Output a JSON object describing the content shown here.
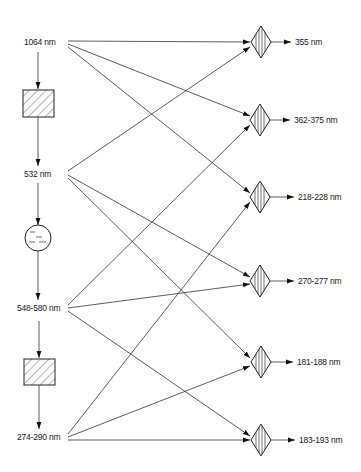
{
  "diagram": {
    "type": "wavelength conversion schematic",
    "sources": [
      {
        "id": "s1064",
        "label": "1064 nm",
        "x": 40,
        "y": 42
      },
      {
        "id": "s532",
        "label": "532 nm",
        "x": 40,
        "y": 174
      },
      {
        "id": "s548",
        "label": "548-580 nm",
        "x": 40,
        "y": 308
      },
      {
        "id": "s274",
        "label": "274-290 nm",
        "x": 40,
        "y": 437
      }
    ],
    "converters_vertical": [
      {
        "id": "shg1",
        "shape": "hatched-box",
        "between": [
          "1064 nm",
          "532 nm"
        ]
      },
      {
        "id": "dye",
        "shape": "circle",
        "between": [
          "532 nm",
          "548-580 nm"
        ]
      },
      {
        "id": "shg2",
        "shape": "hatched-box",
        "between": [
          "548-580 nm",
          "274-290 nm"
        ]
      }
    ],
    "outputs": [
      {
        "id": "o355",
        "label": "355 nm",
        "y": 42
      },
      {
        "id": "o362",
        "label": "362-375 nm",
        "y": 120
      },
      {
        "id": "o218",
        "label": "218-228 nm",
        "y": 197
      },
      {
        "id": "o270",
        "label": "270-277 nm",
        "y": 281
      },
      {
        "id": "o181",
        "label": "181-188 nm",
        "y": 362
      },
      {
        "id": "o183",
        "label": "183-193 nm",
        "y": 440
      }
    ],
    "connections": [
      {
        "from": "1064 nm",
        "to": "355 nm"
      },
      {
        "from": "1064 nm",
        "to": "362-375 nm"
      },
      {
        "from": "1064 nm",
        "to": "218-228 nm"
      },
      {
        "from": "532 nm",
        "to": "355 nm"
      },
      {
        "from": "532 nm",
        "to": "270-277 nm"
      },
      {
        "from": "532 nm",
        "to": "181-188 nm"
      },
      {
        "from": "548-580 nm",
        "to": "362-375 nm"
      },
      {
        "from": "548-580 nm",
        "to": "270-277 nm"
      },
      {
        "from": "548-580 nm",
        "to": "183-193 nm"
      },
      {
        "from": "274-290 nm",
        "to": "218-228 nm"
      },
      {
        "from": "274-290 nm",
        "to": "181-188 nm"
      },
      {
        "from": "274-290 nm",
        "to": "183-193 nm"
      }
    ]
  }
}
